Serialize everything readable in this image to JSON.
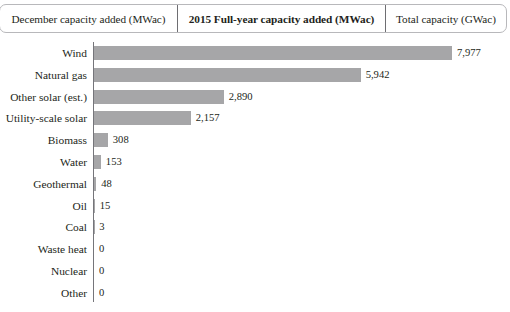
{
  "tabs": [
    {
      "label": "December capacity added (MWac)",
      "active": false
    },
    {
      "label": "2015 Full-year capacity added (MWac)",
      "active": true
    },
    {
      "label": "Total capacity (GWac)",
      "active": false
    }
  ],
  "colors": {
    "bar": "#a6a6a8",
    "axis": "#75757a",
    "text": "#231f20",
    "tab_border": "#b8b8bb",
    "tab_active_divider": "#6e6e72",
    "background": "#ffffff"
  },
  "chart_data": {
    "type": "bar",
    "orientation": "horizontal",
    "title": "",
    "subtitle": "",
    "xlabel": "",
    "ylabel": "",
    "grid": false,
    "legend": null,
    "unit": "MWac",
    "xlim": [
      0,
      7977
    ],
    "categories": [
      "Wind",
      "Natural gas",
      "Other solar (est.)",
      "Utility-scale solar",
      "Biomass",
      "Water",
      "Geothermal",
      "Oil",
      "Coal",
      "Waste heat",
      "Nuclear",
      "Other"
    ],
    "values": [
      7977,
      5942,
      2890,
      2157,
      308,
      153,
      48,
      15,
      3,
      0,
      0,
      0
    ],
    "value_labels": [
      "7,977",
      "5,942",
      "2,890",
      "2,157",
      "308",
      "153",
      "48",
      "15",
      "3",
      "0",
      "0",
      "0"
    ]
  }
}
